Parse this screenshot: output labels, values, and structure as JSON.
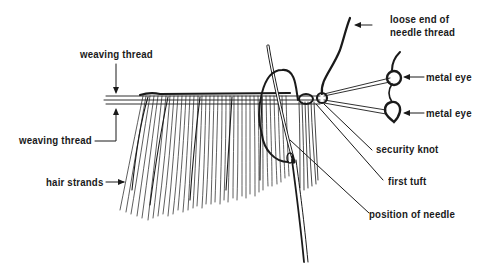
{
  "diagram": {
    "type": "hair-weaving illustration",
    "labels": {
      "weaving_thread_top": "weaving thread",
      "weaving_thread_bottom": "weaving thread",
      "hair_strands": "hair strands",
      "loose_end_line1": "loose end of",
      "loose_end_line2": "needle thread",
      "metal_eye_1": "metal eye",
      "metal_eye_2": "metal eye",
      "security_knot": "security knot",
      "first_tuft": "first tuft",
      "position_of_needle": "position of needle"
    },
    "colors": {
      "ink": "#1a1a1a",
      "background": "#ffffff"
    }
  }
}
